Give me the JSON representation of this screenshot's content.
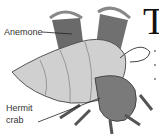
{
  "diagram": {
    "labels": [
      {
        "text": "Anemone"
      },
      {
        "text": "Hermit"
      },
      {
        "text": "crab"
      }
    ],
    "drop_cap": "T",
    "colors": {
      "ink": "#333333",
      "shell": "#c8c8c8",
      "anemone": "#6a6a6a",
      "crab": "#7a7a7a"
    }
  }
}
